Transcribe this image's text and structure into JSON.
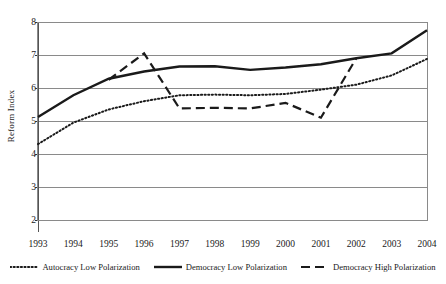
{
  "chart_data": {
    "type": "line",
    "title": "",
    "xlabel": "",
    "ylabel": "Reform Index",
    "x": [
      1993,
      1994,
      1995,
      1996,
      1997,
      1998,
      1999,
      2000,
      2001,
      2002,
      2003,
      2004
    ],
    "categories": [
      "1993",
      "1994",
      "1995",
      "1996",
      "1997",
      "1998",
      "1999",
      "2000",
      "2001",
      "2002",
      "2003",
      "2004"
    ],
    "ylim": [
      2,
      8
    ],
    "yticks": [
      2,
      3,
      4,
      5,
      6,
      7,
      8
    ],
    "ytick_labels": [
      "2",
      "3",
      "4",
      "5",
      "6",
      "7",
      "8"
    ],
    "grid": true,
    "grid_axis": "y",
    "legend_position": "bottom",
    "series": [
      {
        "name": "Autocracy Low Polarization",
        "style": "dotted",
        "color": "#1a1a1a",
        "values": [
          4.3,
          4.95,
          5.35,
          5.6,
          5.78,
          5.8,
          5.78,
          5.82,
          5.95,
          6.1,
          6.38,
          6.88
        ]
      },
      {
        "name": "Democracy Low Polarization",
        "style": "solid",
        "color": "#1a1a1a",
        "values": [
          5.12,
          5.78,
          6.28,
          6.5,
          6.65,
          6.66,
          6.55,
          6.62,
          6.72,
          6.9,
          7.05,
          7.75
        ]
      },
      {
        "name": "Democracy High Polarization",
        "style": "dashed",
        "color": "#1a1a1a",
        "values": [
          null,
          null,
          6.25,
          7.05,
          5.38,
          5.4,
          5.38,
          5.55,
          5.1,
          6.9,
          null,
          null
        ]
      }
    ]
  },
  "legend": {
    "items": [
      {
        "label": "Autocracy Low Polarization",
        "style": "dotted"
      },
      {
        "label": "Democracy Low Polarization",
        "style": "solid"
      },
      {
        "label": "Democracy High Polarization",
        "style": "dashed"
      }
    ]
  },
  "axes": {
    "y_title": "Reform Index"
  }
}
